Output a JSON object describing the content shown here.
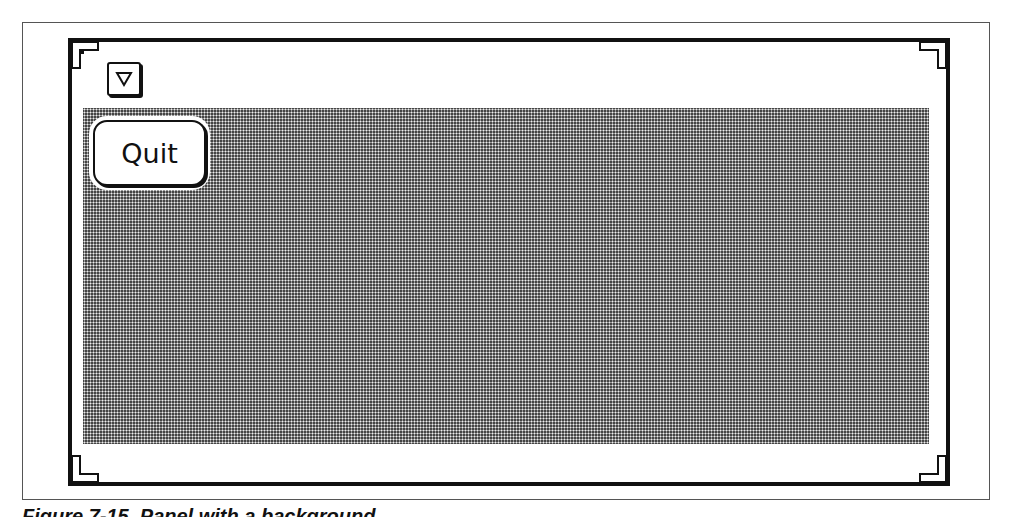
{
  "window": {
    "menu_button_icon": "triangle-down-icon",
    "background_pattern": "dotted-gray",
    "colors": {
      "frame": "#111111",
      "pane_dark": "#444444",
      "pane_dot": "#eeeeee",
      "button_bg": "#ffffff"
    }
  },
  "panel": {
    "quit_label": "Quit"
  },
  "caption": {
    "text": "Figure 7-15. Panel with a background"
  }
}
